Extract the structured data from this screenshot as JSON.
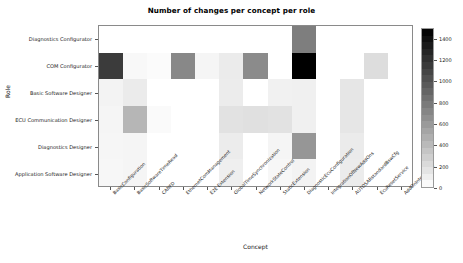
{
  "chart_data": {
    "type": "heatmap",
    "title": "Number of changes per concept per role",
    "xlabel": "Concept",
    "ylabel": "Role",
    "categories_x": [
      "BasicConfiguration",
      "BasicSoftwareTimeRead",
      "CANFD",
      "EthernetComManagement",
      "E2E Extension",
      "GlobalTimeSynchronization",
      "NetworkStateControl",
      "StaticExtension",
      "DiagnosticEcuConfiguration",
      "IntegrationOfNewAddOns",
      "AUTOSARstandardBswCfg",
      "EcuResetService",
      "AddOnIntegration"
    ],
    "categories_y": [
      "Diagnostics Configurator",
      "COM Configurator",
      "Basic Software Designer",
      "ECU Communication Designer",
      "Diagnostics Designer",
      "Application Software Designer"
    ],
    "values": [
      [
        0,
        0,
        0,
        0,
        0,
        0,
        0,
        0,
        760,
        0,
        0,
        0,
        0
      ],
      [
        1150,
        40,
        25,
        700,
        60,
        120,
        680,
        0,
        1500,
        0,
        0,
        200,
        0
      ],
      [
        70,
        120,
        0,
        0,
        0,
        110,
        0,
        80,
        90,
        0,
        150,
        0,
        0
      ],
      [
        60,
        430,
        30,
        0,
        0,
        170,
        180,
        170,
        90,
        0,
        150,
        0,
        0
      ],
      [
        55,
        60,
        0,
        0,
        0,
        110,
        0,
        60,
        620,
        0,
        120,
        0,
        0
      ],
      [
        50,
        60,
        0,
        0,
        0,
        95,
        0,
        50,
        70,
        0,
        110,
        0,
        0
      ]
    ],
    "colorbar": {
      "ticks": [
        0,
        200,
        400,
        600,
        800,
        1000,
        1200,
        1400
      ],
      "min": 0,
      "max": 1500,
      "colormap": "grayscale-inverted",
      "low_color": "#ffffff",
      "high_color": "#000000"
    },
    "grid": false,
    "legend_position": "right"
  }
}
